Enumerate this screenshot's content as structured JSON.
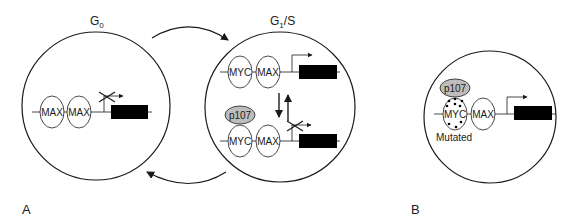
{
  "panels": {
    "a": {
      "label": "A",
      "states": [
        {
          "label_main": "G",
          "label_sub": "0"
        },
        {
          "label_main": "G",
          "label_sub": "1",
          "label_suffix": "/S"
        }
      ],
      "g0": {
        "proteins": [
          "MAX",
          "MAX"
        ],
        "transcription": "blocked"
      },
      "g1s": {
        "top": {
          "proteins": [
            "MYC",
            "MAX"
          ],
          "transcription": "active"
        },
        "bottom": {
          "repressor": "p107",
          "proteins": [
            "MYC",
            "MAX"
          ],
          "transcription": "blocked"
        }
      }
    },
    "b": {
      "label": "B",
      "repressor": "p107",
      "proteins": [
        "MYC",
        "MAX"
      ],
      "mutation_label": "Mutated",
      "transcription": "active"
    }
  },
  "colors": {
    "line": "#1a1a1a",
    "p107_fill": "#bdbdbd",
    "gene_box": "#000000",
    "background": "#ffffff"
  }
}
